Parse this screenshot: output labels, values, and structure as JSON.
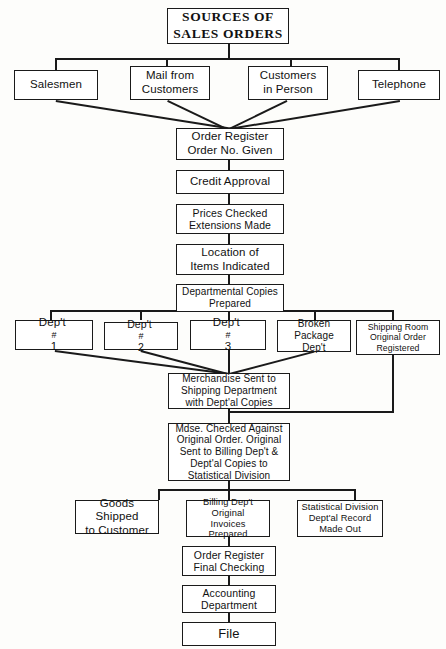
{
  "diagram": {
    "title": "SOURCES OF SALES ORDERS",
    "type": "flowchart",
    "nodes": {
      "title_box": {
        "line1": "SOURCES OF",
        "line2": "SALES ORDERS"
      },
      "sources": [
        {
          "id": "salesmen",
          "line1": "Salesmen",
          "line2": ""
        },
        {
          "id": "mail-from-customers",
          "line1": "Mail from",
          "line2": "Customers"
        },
        {
          "id": "customers-in-person",
          "line1": "Customers",
          "line2": "in Person"
        },
        {
          "id": "telephone",
          "line1": "Telephone",
          "line2": ""
        }
      ],
      "order_register": {
        "line1": "Order Register",
        "line2": "Order No. Given"
      },
      "credit_approval": {
        "line1": "Credit Approval"
      },
      "prices_checked": {
        "line1": "Prices Checked",
        "line2": "Extensions Made"
      },
      "location_items": {
        "line1": "Location of",
        "line2": "Items Indicated"
      },
      "departmental_copies": {
        "line1": "Departmental Copies",
        "line2": "Prepared"
      },
      "departments": [
        {
          "id": "dept-1",
          "prefix": "Dep't",
          "mark": "#",
          "num": "1"
        },
        {
          "id": "dept-2",
          "prefix": "Dep't",
          "mark": "#",
          "num": "2"
        },
        {
          "id": "dept-3",
          "prefix": "Dep't",
          "mark": "#",
          "num": "3"
        }
      ],
      "broken_package": {
        "line1": "Broken",
        "line2": "Package Dep't"
      },
      "shipping_room": {
        "line1": "Shipping Room",
        "line2": "Original Order",
        "line3": "Registered"
      },
      "merchandise_sent": {
        "line1": "Merchandise Sent to",
        "line2": "Shipping Department",
        "line3": "with Dept'al Copies"
      },
      "mdse_checked": {
        "line1": "Mdse. Checked Against",
        "line2": "Original Order. Original",
        "line3": "Sent to Billing Dep't &",
        "line4": "Dept'al Copies to",
        "line5": "Statistical Division"
      },
      "goods_shipped": {
        "line1": "Goods Shipped",
        "line2": "to Customer"
      },
      "billing_dept": {
        "line1": "Billing Dep't",
        "line2": "Original",
        "line3": "Invoices Prepared"
      },
      "statistical_division": {
        "line1": "Statistical Division",
        "line2": "Dept'al Record",
        "line3": "Made Out"
      },
      "order_register_final": {
        "line1": "Order Register",
        "line2": "Final Checking"
      },
      "accounting_department": {
        "line1": "Accounting",
        "line2": "Department"
      },
      "file": {
        "line1": "File"
      }
    },
    "colors": {
      "line": "#1a1a1a",
      "box_fill": "#ffffff",
      "background": "#fdfdfb",
      "text": "#111111"
    }
  }
}
